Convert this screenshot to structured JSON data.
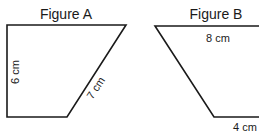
{
  "figures": [
    {
      "title": "Figure A",
      "shape": "right trapezoid",
      "labels": {
        "left_side": "6 cm",
        "slanted_side": "7 cm"
      }
    },
    {
      "title": "Figure B",
      "shape": "trapezoid",
      "labels": {
        "top_side": "8 cm",
        "bottom_side": "4 cm"
      }
    }
  ],
  "colors": {
    "stroke": "#1a1a1a",
    "background": "#ffffff"
  }
}
